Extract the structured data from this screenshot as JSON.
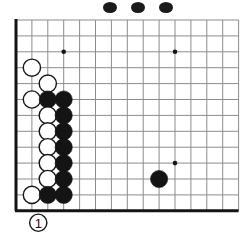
{
  "diagram": {
    "kind": "go-board-problem-diagram",
    "board": {
      "origin_x": 16,
      "origin_y": 20,
      "spacing": 15.9,
      "cols": 14,
      "rows": 12,
      "edges": {
        "left": true,
        "bottom": true,
        "top": false,
        "right": false
      },
      "line_color": "#8c8c8c",
      "edge_color": "#141414",
      "background": "#ffffff"
    },
    "star_points": [
      {
        "col": 3,
        "row": 2
      },
      {
        "col": 10,
        "row": 2
      },
      {
        "col": 10,
        "row": 9
      }
    ],
    "stones": [
      {
        "col": 1,
        "row": 3,
        "color": "white",
        "label": ""
      },
      {
        "col": 2,
        "row": 4,
        "color": "white",
        "label": ""
      },
      {
        "col": 1,
        "row": 5,
        "color": "white",
        "label": ""
      },
      {
        "col": 2,
        "row": 5,
        "color": "black",
        "label": ""
      },
      {
        "col": 3,
        "row": 5,
        "color": "black",
        "label": ""
      },
      {
        "col": 2,
        "row": 6,
        "color": "white",
        "label": ""
      },
      {
        "col": 3,
        "row": 6,
        "color": "black",
        "label": ""
      },
      {
        "col": 2,
        "row": 7,
        "color": "white",
        "label": ""
      },
      {
        "col": 3,
        "row": 7,
        "color": "black",
        "label": ""
      },
      {
        "col": 2,
        "row": 8,
        "color": "white",
        "label": ""
      },
      {
        "col": 3,
        "row": 8,
        "color": "black",
        "label": ""
      },
      {
        "col": 2,
        "row": 9,
        "color": "white",
        "label": ""
      },
      {
        "col": 3,
        "row": 9,
        "color": "black",
        "label": ""
      },
      {
        "col": 2,
        "row": 10,
        "color": "white",
        "label": ""
      },
      {
        "col": 3,
        "row": 10,
        "color": "black",
        "label": ""
      },
      {
        "col": 1,
        "row": 11,
        "color": "white",
        "label": ""
      },
      {
        "col": 2,
        "row": 11,
        "color": "black",
        "label": ""
      },
      {
        "col": 3,
        "row": 11,
        "color": "black",
        "label": ""
      },
      {
        "col": 9,
        "row": 10,
        "color": "black",
        "label": ""
      },
      {
        "col": 1.4,
        "row": 12.75,
        "color": "white",
        "label": "1"
      }
    ],
    "stone_radius": 8.6,
    "colors": {
      "black_stone": "#141414",
      "white_stone_fill": "#ffffff",
      "white_stone_edge": "#141414",
      "label_on_white": "#111111"
    },
    "top_artifacts": [
      {
        "x": 103,
        "y": 2,
        "w": 14,
        "h": 11
      },
      {
        "x": 131,
        "y": 2,
        "w": 14,
        "h": 11
      },
      {
        "x": 159,
        "y": 2,
        "w": 14,
        "h": 11
      }
    ]
  }
}
